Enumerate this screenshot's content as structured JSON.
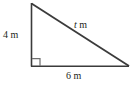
{
  "figure": {
    "type": "right-triangle-diagram",
    "stroke_color": "#3b3b3b",
    "label_color": "#231f20",
    "background_color": "#ffffff",
    "unit": "m",
    "labels": {
      "vertical_leg": "4 m",
      "horizontal_leg": "6 m",
      "hypotenuse_variable": "t",
      "hypotenuse_unit": "m"
    },
    "right_angle_marker": {
      "name": "right-angle-square",
      "present": true
    },
    "vertices": {
      "apex": [
        31,
        3
      ],
      "right_angle": [
        31,
        66
      ],
      "right": [
        129,
        66
      ]
    }
  }
}
